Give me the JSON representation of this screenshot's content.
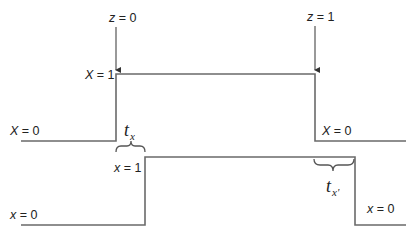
{
  "diagram": {
    "type": "timing-diagram",
    "colors": {
      "line": "#6a6a6a",
      "text": "#222222",
      "background": "#ffffff"
    },
    "events": [
      {
        "label_var": "z",
        "label_eq": " = 0"
      },
      {
        "label_var": "z",
        "label_eq": " = 1"
      }
    ],
    "upper_signal": {
      "name": "X",
      "labels": {
        "high_var": "X",
        "high_eq": " = 1",
        "low_left_var": "X",
        "low_left_eq": " = 0",
        "low_right_var": "X",
        "low_right_eq": " = 0"
      }
    },
    "lower_signal": {
      "name": "x",
      "labels": {
        "high_var": "x",
        "high_eq": " = 1",
        "low_left_var": "x",
        "low_left_eq": " = 0",
        "low_right_var": "x",
        "low_right_eq": " = 0"
      }
    },
    "delays": [
      {
        "symbol": "t",
        "subscript": "x"
      },
      {
        "symbol": "t",
        "subscript": "x'"
      }
    ]
  }
}
